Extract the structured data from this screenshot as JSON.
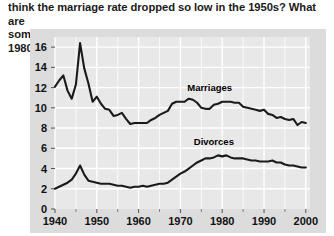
{
  "question": {
    "text": "think the marriage rate dropped so low in the 1950s?  What are\nsome possibilities that caused the divorce rate to peak in 1980?"
  },
  "colors": {
    "panel_background": "#dcdcdc",
    "plot_background": "#e8e8e8",
    "gridline": "#ffffff",
    "line": "#1a1a1a",
    "text": "#111111",
    "page_background": "#ffffff"
  },
  "chart_data": {
    "type": "line",
    "title": "",
    "xlabel": "",
    "ylabel": "Marriages/Divorces per 1,000 persons",
    "xlim": [
      1940,
      2001
    ],
    "ylim": [
      0,
      17
    ],
    "grid": true,
    "legend": "inline-labels",
    "xticks": [
      1940,
      1950,
      1960,
      1970,
      1980,
      1990,
      2000
    ],
    "xtick_labels": [
      "1940",
      "1950",
      "1960",
      "1970",
      "1980",
      "1990",
      "2000"
    ],
    "yticks": [
      0,
      2,
      4,
      6,
      8,
      10,
      12,
      14,
      16
    ],
    "ytick_labels": [
      "0",
      "2",
      "4",
      "6",
      "8",
      "10",
      "12",
      "14",
      "16"
    ],
    "x": [
      1940,
      1941,
      1942,
      1943,
      1944,
      1945,
      1946,
      1947,
      1948,
      1949,
      1950,
      1951,
      1952,
      1953,
      1954,
      1955,
      1956,
      1957,
      1958,
      1959,
      1960,
      1961,
      1962,
      1963,
      1964,
      1965,
      1966,
      1967,
      1968,
      1969,
      1970,
      1971,
      1972,
      1973,
      1974,
      1975,
      1976,
      1977,
      1978,
      1979,
      1980,
      1981,
      1982,
      1983,
      1984,
      1985,
      1986,
      1987,
      1988,
      1989,
      1990,
      1991,
      1992,
      1993,
      1994,
      1995,
      1996,
      1997,
      1998,
      1999,
      2000
    ],
    "series": [
      {
        "name": "Marriages",
        "label_x": 1977,
        "label_y": 11.7,
        "values": [
          12.1,
          12.7,
          13.2,
          11.7,
          10.9,
          12.3,
          16.4,
          13.9,
          12.4,
          10.6,
          11.1,
          10.4,
          9.9,
          9.8,
          9.2,
          9.3,
          9.5,
          8.9,
          8.4,
          8.5,
          8.5,
          8.5,
          8.5,
          8.8,
          9.0,
          9.3,
          9.5,
          9.7,
          10.4,
          10.6,
          10.6,
          10.6,
          10.9,
          10.8,
          10.5,
          10.0,
          9.9,
          9.9,
          10.3,
          10.4,
          10.6,
          10.6,
          10.6,
          10.5,
          10.5,
          10.1,
          10.0,
          9.9,
          9.8,
          9.7,
          9.8,
          9.4,
          9.3,
          9.0,
          9.1,
          8.9,
          8.8,
          8.9,
          8.3,
          8.6,
          8.5
        ]
      },
      {
        "name": "Divorces",
        "label_x": 1978,
        "label_y": 6.3,
        "values": [
          2.0,
          2.2,
          2.4,
          2.6,
          2.9,
          3.5,
          4.3,
          3.4,
          2.8,
          2.7,
          2.6,
          2.5,
          2.5,
          2.5,
          2.4,
          2.3,
          2.3,
          2.2,
          2.1,
          2.2,
          2.2,
          2.3,
          2.2,
          2.3,
          2.4,
          2.5,
          2.5,
          2.6,
          2.9,
          3.2,
          3.5,
          3.7,
          4.0,
          4.3,
          4.6,
          4.8,
          5.0,
          5.0,
          5.1,
          5.3,
          5.2,
          5.3,
          5.1,
          5.0,
          5.0,
          5.0,
          4.9,
          4.8,
          4.8,
          4.7,
          4.7,
          4.7,
          4.8,
          4.6,
          4.6,
          4.4,
          4.3,
          4.3,
          4.2,
          4.1,
          4.1
        ]
      }
    ]
  }
}
